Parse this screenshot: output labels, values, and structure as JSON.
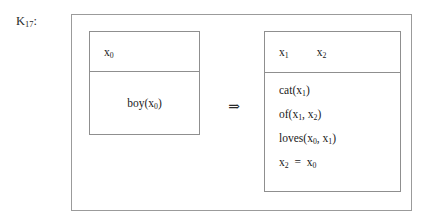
{
  "diagram": {
    "label": "K17:",
    "label_base": "K",
    "label_sub": "17",
    "label_colon": ":",
    "type": "discourse-representation-structure",
    "connective": "⇒",
    "connective_name": "implication-double-arrow"
  },
  "antecedent": {
    "universe": [
      {
        "base": "x",
        "sub": "0"
      }
    ],
    "conditions": [
      {
        "text": "boy(x₀)",
        "func": "boy",
        "open": "(",
        "arg_base": "x",
        "arg_sub": "0",
        "close": ")"
      }
    ]
  },
  "consequent": {
    "universe": [
      {
        "base": "x",
        "sub": "1"
      },
      {
        "base": "x",
        "sub": "2"
      }
    ],
    "conditions": [
      {
        "kind": "predicate",
        "text": "cat(x₁)",
        "func": "cat",
        "open": "(",
        "args": [
          {
            "base": "x",
            "sub": "1"
          }
        ],
        "close": ")"
      },
      {
        "kind": "predicate",
        "text": "of(x₁, x₂)",
        "func": "of",
        "open": "(",
        "args": [
          {
            "base": "x",
            "sub": "1"
          },
          {
            "base": "x",
            "sub": "2"
          }
        ],
        "sep": ", ",
        "close": ")"
      },
      {
        "kind": "predicate",
        "text": "loves(x₀, x₁)",
        "func": "loves",
        "open": "(",
        "args": [
          {
            "base": "x",
            "sub": "0"
          },
          {
            "base": "x",
            "sub": "1"
          }
        ],
        "sep": ", ",
        "close": ")"
      },
      {
        "kind": "equation",
        "text": "x₂ = x₀",
        "lhs": {
          "base": "x",
          "sub": "2"
        },
        "operator": "=",
        "rhs": {
          "base": "x",
          "sub": "0"
        }
      }
    ]
  },
  "colors": {
    "background": "#ffffff",
    "border": "#8f8f8f",
    "outer_border": "#9b9b9b",
    "text": "#1a1a1a"
  }
}
